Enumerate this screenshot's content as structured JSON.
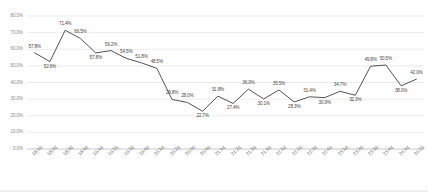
{
  "chart_data": {
    "type": "line",
    "title": "",
    "subtitle": "",
    "xlabel": "",
    "ylabel": "",
    "grid": true,
    "legend": "none",
    "ylim": [
      0,
      80
    ],
    "ytick_labels": [
      "80.0%",
      "70.0%",
      "60.0%",
      "50.0%",
      "40.0%",
      "30.0%",
      "20.0%",
      "10.0%",
      "0.0%"
    ],
    "ytick_values": [
      80,
      70,
      60,
      50,
      40,
      30,
      20,
      10,
      0
    ],
    "categories": [
      "18.1q",
      "18.2q",
      "18.3q",
      "18.4q",
      "19.1q",
      "19.2q",
      "19.3q",
      "19.4q",
      "20.1q",
      "20.2q",
      "20.3q",
      "20.4q",
      "21.1q",
      "21.2q",
      "21.3q",
      "21.4q",
      "22.1q",
      "22.2q",
      "22.3q",
      "22.4q",
      "23.1q",
      "23.2q",
      "23.3q",
      "23.4q",
      "24.1q",
      "24.2q"
    ],
    "values": [
      57.8,
      52.6,
      71.4,
      66.5,
      57.8,
      59.2,
      54.5,
      51.8,
      48.5,
      29.8,
      28.0,
      22.7,
      31.8,
      27.4,
      36.0,
      30.1,
      35.5,
      28.3,
      31.4,
      30.9,
      34.7,
      32.3,
      49.8,
      50.5,
      38.0,
      42.0
    ],
    "data_labels": [
      "57.8%",
      "52.6%",
      "71.4%",
      "66.5%",
      "57.8%",
      "59.2%",
      "54.5%",
      "51.8%",
      "48.5%",
      "29.8%",
      "28.0%",
      "22.7%",
      "31.8%",
      "27.4%",
      "36.0%",
      "30.1%",
      "35.5%",
      "28.3%",
      "31.4%",
      "30.9%",
      "34.7%",
      "32.3%",
      "49.8%",
      "50.5%",
      "38.0%",
      "42.0%"
    ],
    "series_color": "#3f3f3f",
    "grid_color": "#e2e2e2",
    "axis_color": "#c9c9c9"
  }
}
